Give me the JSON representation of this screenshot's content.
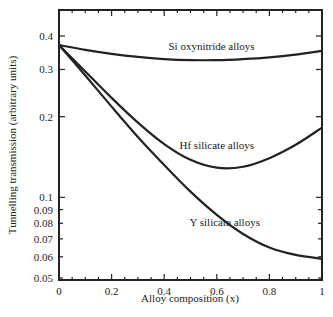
{
  "chart_data": {
    "type": "line",
    "title": "",
    "xlabel": "Alloy composition (x)",
    "ylabel": "Tunnelling transmission (arbitrary units)",
    "xlim": [
      0,
      1
    ],
    "ylim": [
      0.05,
      0.45
    ],
    "yscale": "log",
    "grid": false,
    "legend": "inline labels",
    "x_ticks": [
      0,
      0.2,
      0.4,
      0.6,
      0.8,
      1
    ],
    "x_tick_labels": [
      "0",
      "0.2",
      "0.4",
      "0.6",
      "0.8",
      "1"
    ],
    "y_ticks": [
      0.05,
      0.06,
      0.07,
      0.08,
      0.09,
      0.1,
      0.2,
      0.3,
      0.4
    ],
    "y_tick_labels": [
      "0.05",
      "0.06",
      "0.07",
      "0.08",
      "0.09",
      "0.1",
      "0.2",
      "0.3",
      "0.4"
    ],
    "x": [
      0,
      0.1,
      0.2,
      0.3,
      0.4,
      0.5,
      0.6,
      0.7,
      0.8,
      0.9,
      1.0
    ],
    "series": [
      {
        "name": "Si oxynitride alloys",
        "values": [
          0.37,
          0.355,
          0.343,
          0.334,
          0.328,
          0.325,
          0.325,
          0.328,
          0.333,
          0.341,
          0.352
        ],
        "label_pos": [
          0.58,
          0.355
        ]
      },
      {
        "name": "Hf silicate alloys",
        "values": [
          0.37,
          0.295,
          0.235,
          0.19,
          0.158,
          0.138,
          0.129,
          0.13,
          0.14,
          0.157,
          0.182
        ],
        "label_pos": [
          0.6,
          0.152
        ]
      },
      {
        "name": "Y silicate alloys",
        "values": [
          0.37,
          0.285,
          0.218,
          0.168,
          0.132,
          0.105,
          0.086,
          0.073,
          0.065,
          0.061,
          0.059
        ],
        "label_pos": [
          0.63,
          0.078
        ]
      }
    ]
  }
}
